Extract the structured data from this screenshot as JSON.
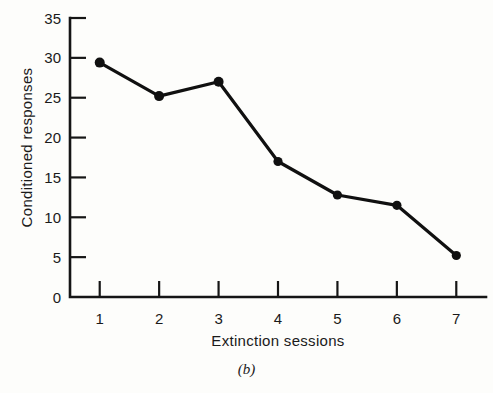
{
  "chart_data": {
    "type": "line",
    "title": "",
    "caption": "(b)",
    "xlabel": "Extinction sessions",
    "ylabel": "Conditioned responses",
    "x": [
      1,
      2,
      3,
      4,
      5,
      6,
      7
    ],
    "categories": [
      "1",
      "2",
      "3",
      "4",
      "5",
      "6",
      "7"
    ],
    "values": [
      29.4,
      25.2,
      27.0,
      17.0,
      12.8,
      11.5,
      5.2
    ],
    "series": [
      {
        "name": "Conditioned responses",
        "values": [
          29.4,
          25.2,
          27.0,
          17.0,
          12.8,
          11.5,
          5.2
        ]
      }
    ],
    "xlim": [
      0.5,
      7.5
    ],
    "ylim": [
      0,
      35
    ],
    "ytick_labels": [
      "0",
      "5",
      "10",
      "15",
      "20",
      "25",
      "30",
      "35"
    ],
    "ytick_values": [
      0,
      5,
      10,
      15,
      20,
      25,
      30,
      35
    ],
    "xtick_labels": [
      "1",
      "2",
      "3",
      "4",
      "5",
      "6",
      "7"
    ],
    "grid": false,
    "legend": false,
    "marker": "filled-circle",
    "line_color": "#101010",
    "marker_color": "#101010",
    "axis_color": "#151515",
    "background_color": "#fdfdfb"
  },
  "axis": {
    "y_ticks": [
      {
        "label": "35",
        "value": 35
      },
      {
        "label": "30",
        "value": 30
      },
      {
        "label": "25",
        "value": 25
      },
      {
        "label": "20",
        "value": 20
      },
      {
        "label": "15",
        "value": 15
      },
      {
        "label": "10",
        "value": 10
      },
      {
        "label": "5",
        "value": 5
      },
      {
        "label": "0",
        "value": 0
      }
    ],
    "x_ticks": [
      {
        "label": "1",
        "value": 1
      },
      {
        "label": "2",
        "value": 2
      },
      {
        "label": "3",
        "value": 3
      },
      {
        "label": "4",
        "value": 4
      },
      {
        "label": "5",
        "value": 5
      },
      {
        "label": "6",
        "value": 6
      },
      {
        "label": "7",
        "value": 7
      }
    ]
  }
}
